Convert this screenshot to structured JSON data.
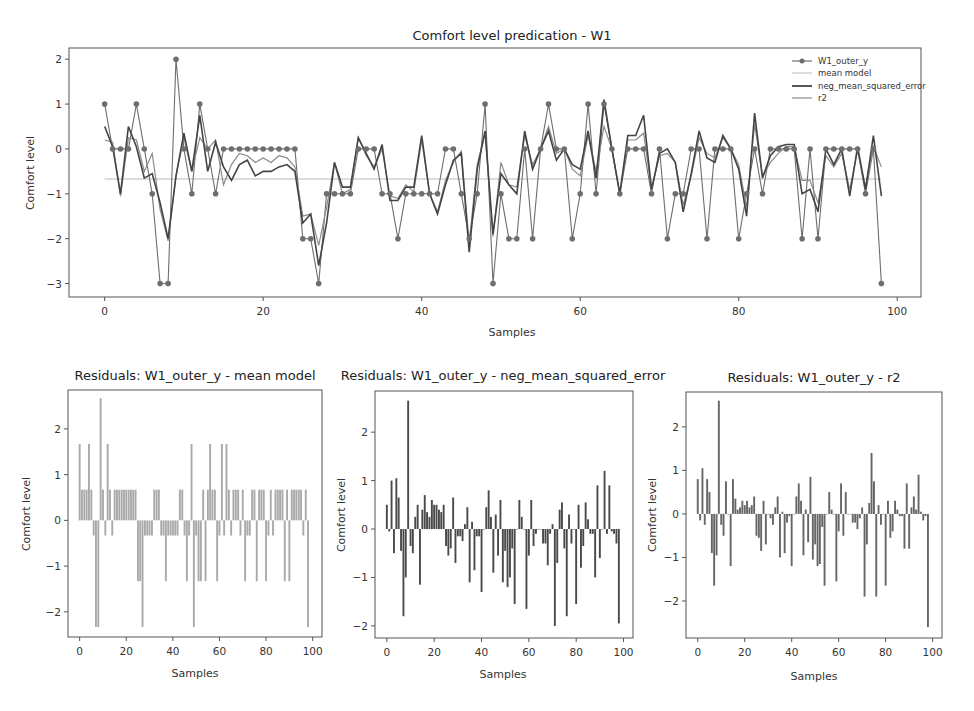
{
  "colors": {
    "observed": "#6e6e6e",
    "mean_model": "#b9b9b9",
    "neg_mse": "#444444",
    "r2": "#8a8a8a",
    "frame": "#555555",
    "bar_mean": "#a9a9a9",
    "bar_nmse": "#4a4a4a",
    "bar_r2": "#666666"
  },
  "chart_data": [
    {
      "id": "main",
      "type": "line",
      "title": "Comfort level predication - W1",
      "xlabel": "Samples",
      "ylabel": "Comfort level",
      "xlim": [
        -4.5,
        103
      ],
      "ylim": [
        -3.3,
        2.25
      ],
      "xticks": [
        0,
        20,
        40,
        60,
        80,
        100
      ],
      "yticks": [
        2,
        1,
        0,
        -1,
        -2,
        -3
      ],
      "grid": false,
      "legend_position": "upper right",
      "legend": [
        "W1_outer_y",
        "mean model",
        "neg_mean_squared_error",
        "r2"
      ],
      "x": [
        0,
        1,
        2,
        3,
        4,
        5,
        6,
        7,
        8,
        9,
        10,
        11,
        12,
        13,
        14,
        15,
        16,
        17,
        18,
        19,
        20,
        21,
        22,
        23,
        24,
        25,
        26,
        27,
        28,
        29,
        30,
        31,
        32,
        33,
        34,
        35,
        36,
        37,
        38,
        39,
        40,
        41,
        42,
        43,
        44,
        45,
        46,
        47,
        48,
        49,
        50,
        51,
        52,
        53,
        54,
        55,
        56,
        57,
        58,
        59,
        60,
        61,
        62,
        63,
        64,
        65,
        66,
        67,
        68,
        69,
        70,
        71,
        72,
        73,
        74,
        75,
        76,
        77,
        78,
        79,
        80,
        81,
        82,
        83,
        84,
        85,
        86,
        87,
        88,
        89,
        90,
        91,
        92,
        93,
        94,
        95,
        96,
        97,
        98
      ],
      "series": [
        {
          "name": "W1_outer_y",
          "style": "line+marker",
          "values": [
            1,
            0,
            0,
            0,
            1,
            0,
            -1,
            -3,
            -3,
            2,
            0,
            -1,
            1,
            0,
            -1,
            0,
            0,
            0,
            0,
            0,
            0,
            0,
            0,
            0,
            0,
            -2,
            -2,
            -3,
            -1,
            -1,
            -1,
            -1,
            0,
            0,
            0,
            -1,
            -1,
            -2,
            -1,
            -1,
            -1,
            -1,
            -1,
            0,
            0,
            -1,
            -2,
            -1,
            1,
            -3,
            -1,
            -2,
            -2,
            0,
            -2,
            0,
            1,
            0,
            0,
            -2,
            -1,
            1,
            -1,
            1,
            0,
            -1,
            0,
            0,
            0,
            -1,
            0,
            -2,
            -1,
            -1,
            0,
            0,
            -2,
            0,
            0,
            0,
            -2,
            -1,
            0,
            -1,
            0,
            0,
            0,
            0,
            -2,
            0,
            -2,
            0,
            0,
            0,
            0,
            0,
            -1,
            0,
            -3
          ]
        },
        {
          "name": "mean model",
          "style": "line",
          "values_constant": -0.67
        },
        {
          "name": "neg_mean_squared_error",
          "style": "line",
          "values": [
            0.5,
            0.05,
            -1.0,
            0.5,
            0.05,
            -0.65,
            -0.55,
            -1.2,
            -2.0,
            -0.6,
            0.35,
            -0.5,
            0.75,
            -0.5,
            0.15,
            -0.4,
            -0.7,
            -0.35,
            -0.25,
            -0.6,
            -0.5,
            -0.5,
            -0.4,
            -0.35,
            -0.5,
            -1.65,
            -1.45,
            -2.6,
            -1.65,
            -0.3,
            -0.85,
            -0.85,
            0.25,
            -0.1,
            -0.45,
            0.1,
            -1.15,
            -1.15,
            -0.85,
            -0.85,
            0.3,
            -1.0,
            -1.45,
            -0.8,
            -0.25,
            -0.1,
            -2.3,
            -0.45,
            0.4,
            -1.9,
            -0.55,
            -0.8,
            -1.0,
            0.4,
            -0.45,
            0.0,
            0.4,
            -0.25,
            0.0,
            -0.35,
            -0.45,
            0.4,
            -0.65,
            1.1,
            0.0,
            -1.0,
            0.3,
            0.3,
            0.75,
            -0.9,
            -0.1,
            0.0,
            -0.3,
            -1.4,
            -0.55,
            0.4,
            -0.2,
            -0.3,
            0.3,
            0.0,
            -0.45,
            -1.5,
            0.8,
            -0.65,
            -0.15,
            0.05,
            0.1,
            0.1,
            -1.0,
            -0.9,
            -1.4,
            0.0,
            -0.35,
            0.0,
            -1.05,
            0.05,
            -0.9,
            0.3,
            -1.05
          ]
        },
        {
          "name": "r2",
          "style": "line",
          "values": [
            0.2,
            0.15,
            -1.05,
            0.25,
            0.2,
            -0.5,
            -0.1,
            -1.35,
            -2.05,
            -0.6,
            0.25,
            -0.5,
            0.25,
            0.0,
            0.2,
            -0.8,
            -0.35,
            -0.1,
            -0.15,
            -0.3,
            -0.2,
            -0.3,
            -0.15,
            -0.2,
            -0.4,
            -1.5,
            -1.45,
            -2.15,
            -1.3,
            -0.3,
            -1.0,
            -0.9,
            0.25,
            -0.15,
            -0.4,
            0.0,
            -1.05,
            -1.1,
            -0.8,
            -0.95,
            0.2,
            -1.0,
            -1.4,
            -0.7,
            -0.3,
            -0.05,
            -2.1,
            -0.35,
            0.35,
            -1.95,
            -0.3,
            -0.8,
            -0.85,
            0.3,
            -0.35,
            0.0,
            0.5,
            -0.1,
            0.0,
            -0.45,
            -0.6,
            0.3,
            -0.5,
            0.5,
            0.0,
            -1.0,
            0.2,
            0.2,
            0.35,
            -0.9,
            -0.15,
            -0.1,
            -0.3,
            -1.25,
            -0.6,
            0.25,
            -0.1,
            -0.2,
            0.25,
            0.0,
            -0.35,
            -1.3,
            0.55,
            -0.6,
            -0.3,
            -0.1,
            0.05,
            0.05,
            -0.7,
            -0.7,
            -1.2,
            -0.15,
            -0.4,
            -0.1,
            -0.9,
            -0.05,
            -0.85,
            0.05,
            -0.4
          ]
        }
      ]
    },
    {
      "id": "res_mean",
      "type": "bar",
      "title": "Residuals: W1_outer_y - mean model",
      "xlabel": "Samples",
      "ylabel": "Comfort level",
      "xlim": [
        -5,
        104
      ],
      "ylim": [
        -2.55,
        2.85
      ],
      "xticks": [
        0,
        20,
        40,
        60,
        80,
        100
      ],
      "yticks": [
        2,
        1,
        0,
        -1,
        -2
      ],
      "values": [
        1.67,
        0.67,
        0.67,
        0.67,
        1.67,
        0.67,
        -0.33,
        -2.33,
        -2.33,
        2.67,
        0.67,
        -0.33,
        1.67,
        0.67,
        -0.33,
        0.67,
        0.67,
        0.67,
        0.67,
        0.67,
        0.67,
        0.67,
        0.67,
        0.67,
        0.67,
        -1.33,
        -1.33,
        -2.33,
        -0.33,
        -0.33,
        -0.33,
        -0.33,
        0.67,
        0.67,
        0.67,
        -0.33,
        -0.33,
        -1.33,
        -0.33,
        -0.33,
        -0.33,
        -0.33,
        -0.33,
        0.67,
        0.67,
        -0.33,
        -1.33,
        -0.33,
        1.67,
        -2.33,
        -0.33,
        -1.33,
        -1.33,
        0.67,
        -1.33,
        0.67,
        1.67,
        0.67,
        0.67,
        -1.33,
        -0.33,
        1.67,
        -0.33,
        1.67,
        0.67,
        -0.33,
        0.67,
        0.67,
        0.67,
        -0.33,
        0.67,
        -1.33,
        -0.33,
        -0.33,
        0.67,
        0.67,
        -1.33,
        0.67,
        0.67,
        0.67,
        -1.33,
        -0.33,
        0.67,
        -0.33,
        0.67,
        0.67,
        0.67,
        0.67,
        -1.33,
        0.67,
        -1.33,
        0.67,
        0.67,
        0.67,
        0.67,
        0.67,
        -0.33,
        0.67,
        -2.33
      ]
    },
    {
      "id": "res_nmse",
      "type": "bar",
      "title": "Residuals: W1_outer_y - neg_mean_squared_error",
      "xlabel": "Samples",
      "ylabel": "Comfort level",
      "xlim": [
        -5,
        104
      ],
      "ylim": [
        -2.25,
        2.85
      ],
      "xticks": [
        0,
        20,
        40,
        60,
        80,
        100
      ],
      "yticks": [
        2,
        1,
        0,
        -1,
        -2
      ],
      "values": [
        0.5,
        -0.05,
        1.0,
        -0.5,
        1.05,
        0.65,
        -0.45,
        -1.8,
        -1.0,
        2.65,
        -0.35,
        -0.5,
        0.25,
        0.5,
        -1.15,
        0.4,
        0.7,
        0.35,
        0.25,
        0.6,
        0.5,
        0.5,
        0.4,
        0.35,
        0.5,
        -0.35,
        -0.55,
        -0.4,
        0.65,
        -0.7,
        -0.15,
        -0.15,
        -0.25,
        0.1,
        0.45,
        -1.1,
        0.15,
        -0.85,
        -0.15,
        -0.15,
        -1.3,
        0.0,
        0.45,
        0.8,
        0.25,
        -0.9,
        0.3,
        -0.55,
        0.6,
        -1.1,
        -0.45,
        -1.2,
        -1.0,
        -0.4,
        -1.55,
        0.0,
        0.6,
        0.25,
        0.0,
        -1.65,
        -0.55,
        0.6,
        -0.35,
        -0.1,
        0.0,
        0.0,
        -0.3,
        -0.3,
        -0.75,
        -0.1,
        0.1,
        -2.0,
        -0.7,
        0.4,
        0.55,
        -0.4,
        -1.8,
        0.3,
        -0.3,
        0.0,
        -1.55,
        0.5,
        -0.8,
        -0.35,
        0.55,
        0.2,
        -0.1,
        -0.1,
        -1.0,
        0.9,
        -0.6,
        0.0,
        1.2,
        -0.1,
        0.9,
        -0.05,
        -0.1,
        -0.3,
        -1.95
      ]
    },
    {
      "id": "res_r2",
      "type": "bar",
      "title": "Residuals: W1_outer_y - r2",
      "xlabel": "Samples",
      "ylabel": "Comfort level",
      "xlim": [
        -5,
        104
      ],
      "ylim": [
        -2.85,
        2.8
      ],
      "xticks": [
        0,
        20,
        40,
        60,
        80,
        100
      ],
      "yticks": [
        2,
        1,
        0,
        -1,
        -2
      ],
      "values": [
        0.8,
        -0.15,
        1.05,
        -0.25,
        0.8,
        0.5,
        -0.9,
        -1.65,
        -0.95,
        2.6,
        -0.25,
        -0.5,
        0.75,
        0.0,
        -1.2,
        0.8,
        0.35,
        0.1,
        0.15,
        0.3,
        0.2,
        0.3,
        0.15,
        0.2,
        0.4,
        -0.5,
        -0.55,
        -0.85,
        0.3,
        -0.7,
        0.0,
        -0.1,
        -0.25,
        0.15,
        0.4,
        -1.0,
        0.05,
        -0.9,
        -0.2,
        -0.05,
        -1.2,
        0.0,
        0.4,
        0.7,
        0.3,
        -0.95,
        0.1,
        -0.65,
        0.85,
        -1.05,
        -0.7,
        -1.2,
        -1.15,
        -0.3,
        -1.65,
        0.0,
        0.5,
        0.1,
        0.0,
        -1.55,
        -0.4,
        0.7,
        -0.5,
        0.5,
        0.0,
        0.0,
        -0.2,
        -0.2,
        -0.35,
        -0.1,
        0.15,
        -1.9,
        -0.7,
        0.25,
        1.4,
        0.75,
        -1.9,
        0.2,
        -0.25,
        0.0,
        -1.65,
        0.3,
        -0.55,
        -0.4,
        0.3,
        0.1,
        -0.05,
        -0.05,
        -0.8,
        0.7,
        -0.8,
        0.15,
        0.4,
        0.1,
        0.9,
        0.05,
        -0.15,
        -0.05,
        -2.6
      ]
    }
  ]
}
